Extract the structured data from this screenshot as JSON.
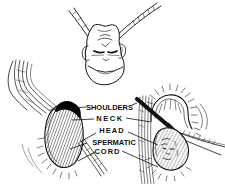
{
  "figure": {
    "background_color": "#ffffff",
    "ink_color": "#111111",
    "labels": {
      "shoulders": "SHOULDERS",
      "neck": "NECK",
      "head": "HEAD",
      "spermatic_cord_line1": "SPERMATIC",
      "spermatic_cord_line2": "CORD"
    },
    "illustrations": {
      "top": "inverted-head-figure",
      "bottom_left": "hernia-sac-left-figure",
      "bottom_right": "hernia-sac-right-figure"
    }
  }
}
